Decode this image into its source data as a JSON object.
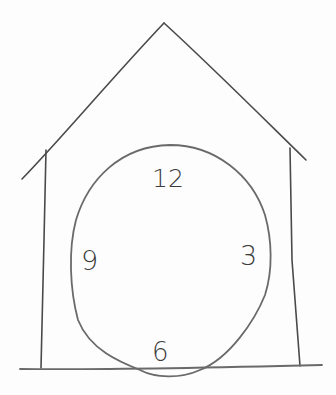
{
  "drawing": {
    "subject": "cuckoo clock house sketch",
    "medium": "pencil",
    "stroke_color": "#4a4a4a",
    "background_color": "#fdfdfd"
  },
  "clock": {
    "numerals": [
      {
        "label": "12",
        "position": "top"
      },
      {
        "label": "3",
        "position": "right"
      },
      {
        "label": "6",
        "position": "bottom"
      },
      {
        "label": "9",
        "position": "left"
      }
    ]
  }
}
